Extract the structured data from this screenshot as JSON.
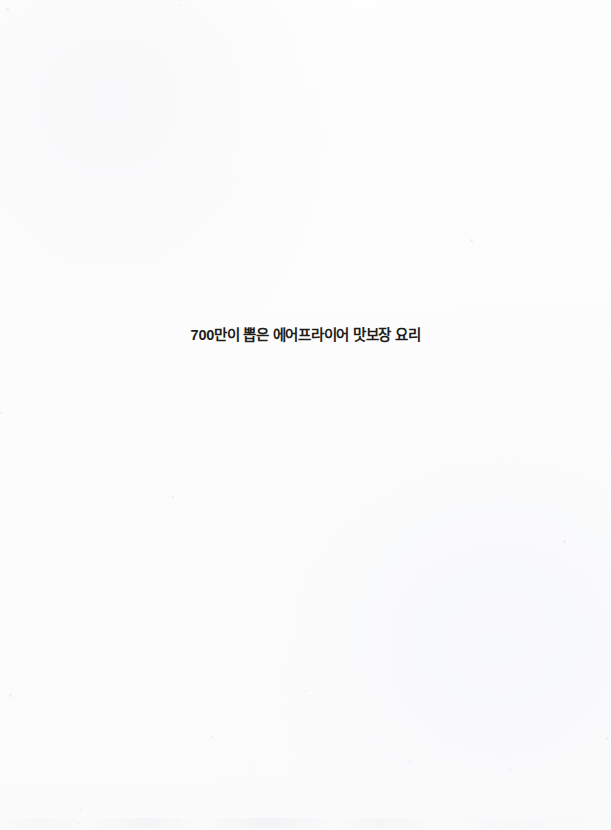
{
  "page": {
    "kind": "scanned-book-page",
    "width": 611,
    "height": 830,
    "background_color": "#fdfdfd"
  },
  "headline": {
    "text": "700만이 뽑은 에어프라이어 맛보장 요리",
    "color": "#1d1d1a",
    "weight": "bold",
    "align": "center"
  },
  "artifacts": {
    "bottom_smudge_label": "",
    "speckles": [
      {
        "x": 6,
        "y": 8,
        "size": 3
      },
      {
        "x": 178,
        "y": 4,
        "size": 2
      },
      {
        "x": 470,
        "y": 239,
        "size": 3
      },
      {
        "x": 563,
        "y": 540,
        "size": 3
      },
      {
        "x": 172,
        "y": 496,
        "size": 2
      },
      {
        "x": 9,
        "y": 694,
        "size": 3
      },
      {
        "x": 606,
        "y": 737,
        "size": 3
      },
      {
        "x": 509,
        "y": 769,
        "size": 2
      },
      {
        "x": 211,
        "y": 736,
        "size": 2
      },
      {
        "x": 80,
        "y": 809,
        "size": 2
      },
      {
        "x": 0,
        "y": 412,
        "size": 2
      },
      {
        "x": 305,
        "y": 690,
        "size": 2
      },
      {
        "x": 409,
        "y": 760,
        "size": 2
      },
      {
        "x": 78,
        "y": 822,
        "size": 2
      }
    ]
  }
}
